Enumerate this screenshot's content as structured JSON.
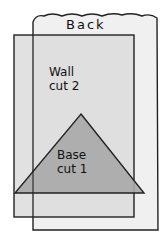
{
  "diagram": {
    "pieces": [
      {
        "id": "back",
        "label": "Back",
        "shape": "rectangle-wavy-top",
        "fill": "#f0f0f0"
      },
      {
        "id": "wall",
        "label_line1": "Wall",
        "label_line2": "cut 2",
        "shape": "rectangle",
        "fill": "#dcdcdc"
      },
      {
        "id": "base",
        "label_line1": "Base",
        "label_line2": "cut 1",
        "shape": "triangle",
        "fill": "#a9a9a9"
      }
    ],
    "stroke_color": "#222222"
  }
}
